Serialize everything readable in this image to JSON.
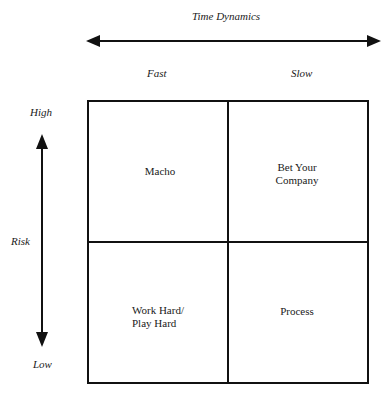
{
  "x_axis": {
    "title": "Time Dynamics",
    "left_label": "Fast",
    "right_label": "Slow"
  },
  "y_axis": {
    "title": "Risk",
    "top_label": "High",
    "bottom_label": "Low"
  },
  "quadrants": {
    "top_left": "Macho",
    "top_right_line1": "Bet Your",
    "top_right_line2": "Company",
    "bottom_left_line1": "Work Hard/",
    "bottom_left_line2": "Play Hard",
    "bottom_right": "Process"
  },
  "colors": {
    "line": "#111111",
    "background": "#ffffff"
  }
}
